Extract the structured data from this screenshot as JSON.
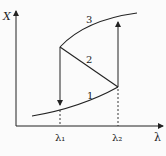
{
  "diagram": {
    "y_axis_label": "X",
    "x_axis_label": "λ",
    "tick_labels": {
      "lambda1": "λ₁",
      "lambda2": "λ₂"
    },
    "branch_labels": {
      "lower": "1",
      "middle": "2",
      "upper": "3"
    },
    "colors": {
      "stroke": "#222222",
      "background": "#fbfbfb"
    }
  }
}
